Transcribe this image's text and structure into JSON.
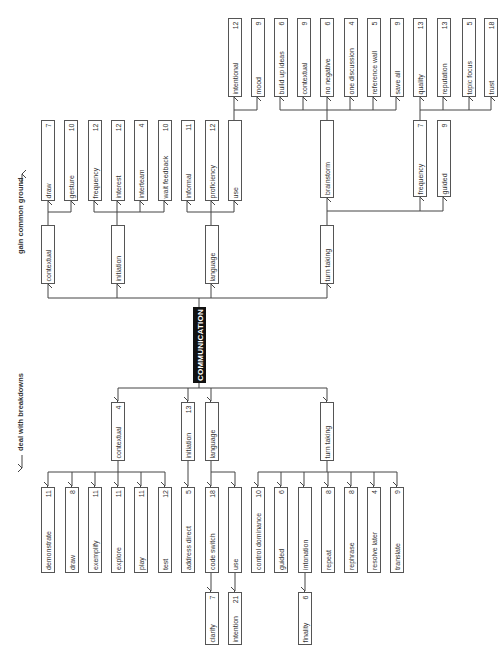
{
  "diagram": {
    "root": "COMMUNICATION",
    "directions": {
      "top": "gain common ground",
      "bottom": "deal with breakdowns"
    },
    "colors": {
      "line": "#444444",
      "box_border": "#555555",
      "root_fill": "#111111",
      "root_text": "#ffffff"
    }
  },
  "nodes": {
    "g_contextual": {
      "label": "contextual",
      "count": ""
    },
    "g_initiation": {
      "label": "initiation",
      "count": ""
    },
    "g_language": {
      "label": "language",
      "count": ""
    },
    "g_turn_taking": {
      "label": "turn taking",
      "count": ""
    },
    "g_draw": {
      "label": "draw",
      "count": "7"
    },
    "g_gesture": {
      "label": "gesture",
      "count": "10"
    },
    "g_frequency": {
      "label": "frequency",
      "count": "12"
    },
    "g_interest": {
      "label": "interest",
      "count": "12"
    },
    "g_interteam": {
      "label": "interteam",
      "count": "4"
    },
    "g_wait_feedback": {
      "label": "wait feedback",
      "count": "10"
    },
    "g_informal": {
      "label": "informal",
      "count": "11"
    },
    "g_proficiency": {
      "label": "proficiency",
      "count": "12"
    },
    "g_use": {
      "label": "use",
      "count": ""
    },
    "g_intentional": {
      "label": "intentional",
      "count": "12"
    },
    "g_mood": {
      "label": "mood",
      "count": "9"
    },
    "g_brainstorm": {
      "label": "brainstorm",
      "count": ""
    },
    "g_build_up_ideas": {
      "label": "build up ideas",
      "count": "6"
    },
    "g_contextual2": {
      "label": "contextual",
      "count": "9"
    },
    "g_no_negative": {
      "label": "no negative",
      "count": "6"
    },
    "g_one_discussion": {
      "label": "one discussion",
      "count": "4"
    },
    "g_reference_wall": {
      "label": "reference wall",
      "count": "5"
    },
    "g_save_all": {
      "label": "save all",
      "count": "9"
    },
    "g_tt_frequency": {
      "label": "frequency",
      "count": "7"
    },
    "g_guided": {
      "label": "guided",
      "count": "9"
    },
    "g_quality": {
      "label": "quality",
      "count": "13"
    },
    "g_reputation": {
      "label": "reputation",
      "count": "13"
    },
    "g_topic_focus": {
      "label": "topic focus",
      "count": "5"
    },
    "g_trust": {
      "label": "trust",
      "count": "18"
    },
    "d_contextual": {
      "label": "contextual",
      "count": "4"
    },
    "d_initiation": {
      "label": "initiation",
      "count": "13"
    },
    "d_language": {
      "label": "language",
      "count": ""
    },
    "d_turn_taking": {
      "label": "turn taking",
      "count": ""
    },
    "d_demonstrate": {
      "label": "demonstrate",
      "count": "11"
    },
    "d_draw": {
      "label": "draw",
      "count": "8"
    },
    "d_exemplify": {
      "label": "exemplify",
      "count": "11"
    },
    "d_explore": {
      "label": "explore",
      "count": "11"
    },
    "d_play": {
      "label": "play",
      "count": "11"
    },
    "d_test": {
      "label": "test",
      "count": "12"
    },
    "d_address_direct": {
      "label": "address direct",
      "count": "5"
    },
    "d_code_switch": {
      "label": "code switch",
      "count": "18"
    },
    "d_use": {
      "label": "use",
      "count": ""
    },
    "d_control_dominance": {
      "label": "control dominance",
      "count": "10"
    },
    "d_guided": {
      "label": "guided",
      "count": "6"
    },
    "d_intonation": {
      "label": "intonation",
      "count": ""
    },
    "d_repeat": {
      "label": "repeat",
      "count": "8"
    },
    "d_rephrase": {
      "label": "rephrase",
      "count": "8"
    },
    "d_resolve_later": {
      "label": "resolve later",
      "count": "4"
    },
    "d_translate": {
      "label": "translate",
      "count": "9"
    },
    "d_clarify": {
      "label": "clarify",
      "count": "7"
    },
    "d_intention": {
      "label": "intention",
      "count": "21"
    },
    "d_finality": {
      "label": "finality",
      "count": "6"
    }
  }
}
